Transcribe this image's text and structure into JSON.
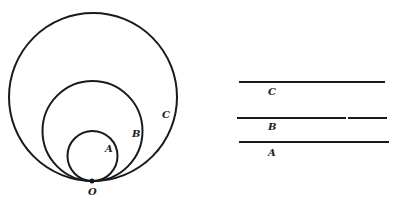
{
  "figure": {
    "left_panel": {
      "description": "Three circles internally tangent at common point O",
      "origin": {
        "label": "O",
        "x": 92,
        "y": 181,
        "label_x": 92,
        "label_y": 194
      },
      "circles": [
        {
          "label": "C",
          "cx": 93,
          "cy": 97,
          "r": 84,
          "label_x": 166,
          "label_y": 118
        },
        {
          "label": "B",
          "cx": 92.5,
          "cy": 131,
          "r": 50,
          "label_x": 136,
          "label_y": 137
        },
        {
          "label": "A",
          "cx": 92.5,
          "cy": 156,
          "r": 25,
          "label_x": 109,
          "label_y": 152
        }
      ]
    },
    "right_panel": {
      "description": "Three horizontal line segments labeled C, B, A",
      "lines": [
        {
          "label": "C",
          "x1": 239,
          "x2": 385,
          "y": 82,
          "label_x": 271,
          "label_y": 95
        },
        {
          "label": "B",
          "x1": 237,
          "x2": 387,
          "y": 118,
          "label_x": 271,
          "label_y": 130
        },
        {
          "label": "A",
          "x1": 239,
          "x2": 389,
          "y": 142,
          "label_x": 271,
          "label_y": 156
        }
      ]
    },
    "colors": {
      "ink": "#1a1a1a",
      "background": "#ffffff"
    }
  }
}
